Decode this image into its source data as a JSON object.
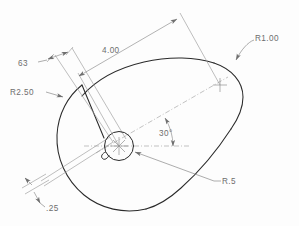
{
  "drawing": {
    "title": "Teardrop cam plate — dimensioned CAD outline",
    "background_color": "#fdfdfd",
    "outline_color": "#2a2a2a",
    "dimension_color": "#8a8a8a",
    "text_color": "#6d6d6d",
    "units": "inches"
  },
  "dimensions": [
    {
      "id": "overall-length",
      "label": "4.00",
      "kind": "linear",
      "value": 4.0,
      "description": "center-to-center distance between the R2.50 arc center and the R1.00 arc center"
    },
    {
      "id": "slot-length",
      "label": "63",
      "kind": "linear",
      "value": 0.63,
      "description": "width of the inclined slot measured at its upper end"
    },
    {
      "id": "slot-width",
      "label": ".25",
      "kind": "linear",
      "value": 0.25,
      "description": "width of the narrow inclined slot at the lower left"
    },
    {
      "id": "angle",
      "label": "30°",
      "kind": "angular",
      "value": 30,
      "description": "angle between the horizontal centerline and the axis joining the two arc centers"
    },
    {
      "id": "large-radius",
      "label": "R2.50",
      "kind": "radius",
      "value": 2.5,
      "description": "radius of the large left-hand arc"
    },
    {
      "id": "small-radius",
      "label": "R1.00",
      "kind": "radius",
      "value": 1.0,
      "description": "radius of the small right-hand nose arc"
    },
    {
      "id": "hole-radius",
      "label": "R.5",
      "kind": "radius",
      "value": 0.5,
      "description": "radius of the central bore at the R2.50 arc center"
    }
  ],
  "labels": {
    "overall_length": "4.00",
    "slot_length": "63",
    "slot_width": ".25",
    "angle": "30°",
    "large_radius": "R2.50",
    "small_radius": "R1.00",
    "hole_radius": "R.5"
  }
}
